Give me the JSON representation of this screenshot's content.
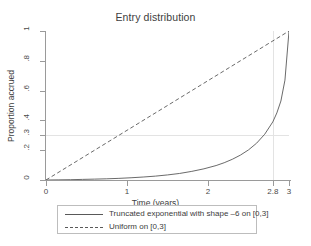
{
  "chart_data": {
    "type": "line",
    "title": "Entry distribution",
    "xlabel": "Time (years)",
    "ylabel": "Proportion accrued",
    "xlim": [
      0,
      3
    ],
    "ylim": [
      0,
      1
    ],
    "grid": false,
    "legend_position": "bottom-outside",
    "x_ticks": [
      {
        "value": 0,
        "label": "0"
      },
      {
        "value": 1,
        "label": "1"
      },
      {
        "value": 2,
        "label": "2"
      },
      {
        "value": 2.8,
        "label": "2.8"
      },
      {
        "value": 3,
        "label": "3"
      }
    ],
    "y_ticks": [
      {
        "value": 0,
        "label": "0"
      },
      {
        "value": 0.2,
        "label": ".2"
      },
      {
        "value": 0.3,
        "label": ".3"
      },
      {
        "value": 0.4,
        "label": ".4"
      },
      {
        "value": 0.6,
        "label": ".6"
      },
      {
        "value": 0.8,
        "label": ".8"
      },
      {
        "value": 1,
        "label": "1"
      }
    ],
    "reference_lines": [
      {
        "orientation": "horizontal",
        "value": 0.3,
        "color": "#e3e3e3"
      },
      {
        "orientation": "vertical",
        "value": 2.8,
        "color": "#e3e3e3"
      }
    ],
    "series": [
      {
        "name": "Truncated exponential with shape –6 on [0,3]",
        "style": "solid",
        "color": "#595959",
        "x": [
          0,
          0.15,
          0.3,
          0.45,
          0.6,
          0.75,
          0.9,
          1.05,
          1.2,
          1.35,
          1.5,
          1.65,
          1.8,
          1.95,
          2.1,
          2.2,
          2.3,
          2.4,
          2.5,
          2.6,
          2.7,
          2.8,
          2.85,
          2.9,
          2.95,
          3
        ],
        "y": [
          0,
          0.001,
          0.002,
          0.004,
          0.006,
          0.008,
          0.011,
          0.015,
          0.02,
          0.026,
          0.034,
          0.044,
          0.058,
          0.075,
          0.097,
          0.116,
          0.139,
          0.167,
          0.202,
          0.247,
          0.307,
          0.39,
          0.45,
          0.53,
          0.67,
          1.0
        ]
      },
      {
        "name": "Uniform on [0,3]",
        "style": "dashed",
        "color": "#595959",
        "x": [
          0,
          3
        ],
        "y": [
          0,
          1
        ]
      }
    ]
  },
  "legend": {
    "items": [
      {
        "label": "Truncated exponential with shape –6 on [0,3]",
        "style": "solid"
      },
      {
        "label": "Uniform on [0,3]",
        "style": "dashed"
      }
    ]
  }
}
